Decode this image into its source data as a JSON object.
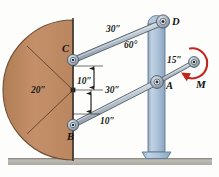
{
  "figure": {
    "background_color": "#fdfdfb"
  },
  "colors": {
    "plate_fill": "#c08c64",
    "plate_edge": "#6e5136",
    "column_fill": "#a8bed4",
    "column_edge": "#5f7b96",
    "link_fill": "#b9c4cf",
    "link_edge": "#4d5a66",
    "ground_fill": "#b8b6ae",
    "moment_color": "#c0261d",
    "dimension_color": "#1a1a1a",
    "wall_line": "#3a3430"
  },
  "labels": {
    "plate_radius": "20″",
    "upper_link_length": "30″",
    "lower_link_length": "30″",
    "angle_at_d": "60°",
    "offset_upper": "10″",
    "offset_lower": "10″",
    "crank_length": "15″",
    "moment": "M"
  },
  "points": [
    {
      "id": "D",
      "label": "D",
      "x": 163,
      "y": 22,
      "role": "upper-pin-top"
    },
    {
      "id": "C",
      "label": "C",
      "x": 73,
      "y": 60,
      "role": "upper-pin-plate"
    },
    {
      "id": "A",
      "label": "A",
      "x": 157,
      "y": 82,
      "role": "lower-pin-column"
    },
    {
      "id": "B",
      "label": "B",
      "x": 73,
      "y": 125,
      "role": "lower-pin-plate"
    },
    {
      "id": "E",
      "label": "",
      "x": 194,
      "y": 62,
      "role": "crank-end-pin"
    }
  ],
  "geometry": {
    "plate_center": {
      "x": 73,
      "y": 90
    },
    "plate_radius_px": 70,
    "wall_x": 73,
    "column_x": 156,
    "ground_y": 160
  }
}
